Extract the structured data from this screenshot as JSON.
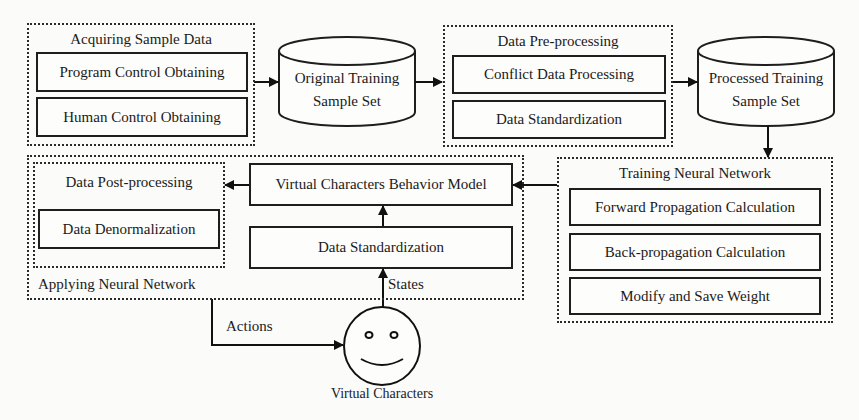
{
  "diagram": {
    "type": "flowchart",
    "groups": {
      "acquiring": {
        "title": "Acquiring Sample Data",
        "items": [
          "Program Control Obtaining",
          "Human Control Obtaining"
        ]
      },
      "preprocessing": {
        "title": "Data Pre-processing",
        "items": [
          "Conflict Data Processing",
          "Data Standardization"
        ]
      },
      "training": {
        "title": "Training Neural Network",
        "items": [
          "Forward Propagation Calculation",
          "Back-propagation Calculation",
          "Modify and Save Weight"
        ]
      },
      "applying": {
        "title": "Applying Neural Network",
        "postprocessing": {
          "title": "Data Post-processing",
          "items": [
            "Data Denormalization"
          ]
        },
        "behavior_model": "Virtual Characters Behavior Model",
        "standardization": "Data Standardization"
      }
    },
    "datastores": {
      "original": {
        "line1": "Original Training",
        "line2": "Sample Set"
      },
      "processed": {
        "line1": "Processed Training",
        "line2": "Sample Set"
      }
    },
    "actor": {
      "label": "Virtual Characters",
      "icon": "smiley-face-icon"
    },
    "edge_labels": {
      "states": "States",
      "actions": "Actions"
    },
    "edges": [
      {
        "from": "Acquiring Sample Data",
        "to": "Original Training Sample Set"
      },
      {
        "from": "Original Training Sample Set",
        "to": "Data Pre-processing"
      },
      {
        "from": "Data Pre-processing",
        "to": "Processed Training Sample Set"
      },
      {
        "from": "Processed Training Sample Set",
        "to": "Training Neural Network"
      },
      {
        "from": "Training Neural Network",
        "to": "Virtual Characters Behavior Model"
      },
      {
        "from": "Virtual Characters Behavior Model",
        "to": "Data Post-processing"
      },
      {
        "from": "Data Standardization",
        "to": "Virtual Characters Behavior Model"
      },
      {
        "from": "Virtual Characters",
        "to": "Data Standardization",
        "label": "States"
      },
      {
        "from": "Applying Neural Network",
        "to": "Virtual Characters",
        "label": "Actions"
      }
    ]
  }
}
